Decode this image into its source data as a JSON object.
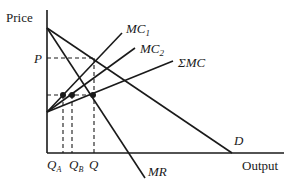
{
  "diagram": {
    "axes": {
      "y_label": "Price",
      "x_label": "Output"
    },
    "curves": {
      "mc1": "MC",
      "mc1_sub": "1",
      "mc2": "MC",
      "mc2_sub": "2",
      "sum_mc": "ΣMC",
      "mr": "MR",
      "demand": "D"
    },
    "price_label": "P",
    "quantities": {
      "qa": "Q",
      "qa_sub": "A",
      "qb": "Q",
      "qb_sub": "B",
      "q": "Q"
    },
    "colors": {
      "line": "#1a1a1a",
      "background": "#ffffff"
    }
  }
}
